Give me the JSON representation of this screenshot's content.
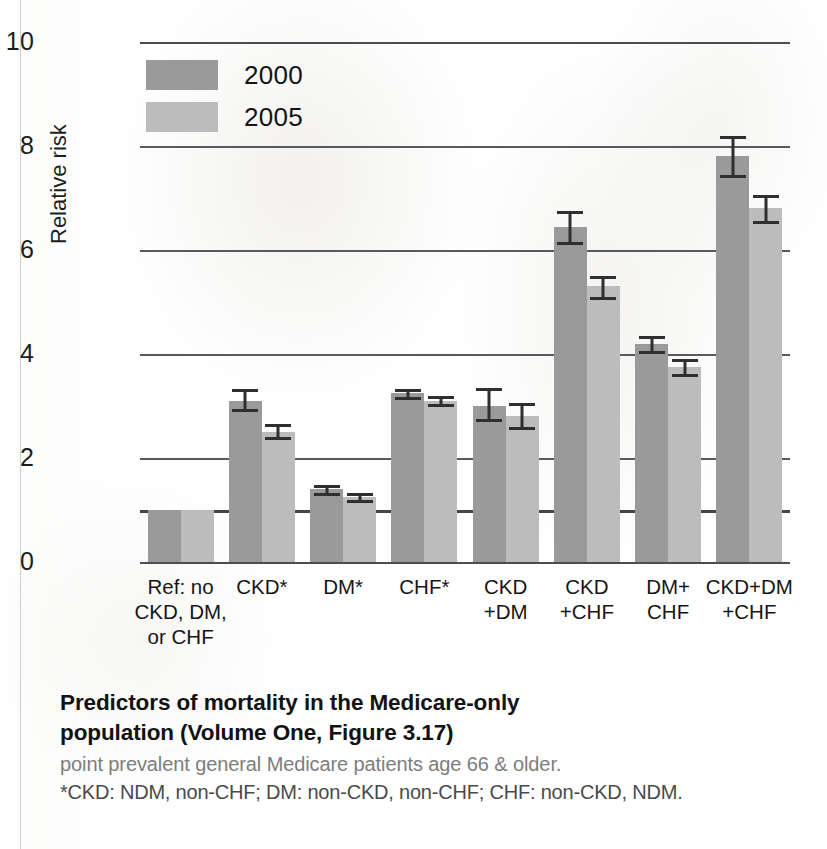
{
  "chart_data": {
    "type": "bar",
    "title": "Predictors of mortality in the Medicare-only population (Volume One, Figure 3.17)",
    "xlabel": "",
    "ylabel": "Relative risk",
    "ylim": [
      0,
      10
    ],
    "yticks": [
      0,
      2,
      4,
      6,
      8,
      10
    ],
    "grid": true,
    "legend_position": "top-left",
    "reference_line": 1,
    "categories": [
      "Ref: no\nCKD, DM,\nor CHF",
      "CKD*",
      "DM*",
      "CHF*",
      "CKD\n+DM",
      "CKD\n+CHF",
      "DM+\nCHF",
      "CKD+DM\n+CHF"
    ],
    "series": [
      {
        "name": "2000",
        "color": "#9a9a9a",
        "values": [
          1.0,
          3.1,
          1.4,
          3.25,
          3.0,
          6.45,
          4.2,
          7.8
        ],
        "err_low": [
          null,
          2.95,
          1.33,
          3.17,
          2.75,
          6.15,
          4.05,
          7.45
        ],
        "err_high": [
          null,
          3.32,
          1.48,
          3.33,
          3.35,
          6.75,
          4.35,
          8.2
        ]
      },
      {
        "name": "2005",
        "color": "#bcbcbc",
        "values": [
          1.0,
          2.5,
          1.25,
          3.1,
          2.8,
          5.3,
          3.75,
          6.8
        ],
        "err_low": [
          null,
          2.4,
          1.2,
          3.03,
          2.6,
          5.1,
          3.62,
          6.55
        ],
        "err_high": [
          null,
          2.65,
          1.33,
          3.2,
          3.05,
          5.5,
          3.9,
          7.05
        ]
      }
    ]
  },
  "legend": {
    "items": [
      {
        "label": "2000",
        "color": "#9a9a9a"
      },
      {
        "label": "2005",
        "color": "#bcbcbc"
      }
    ]
  },
  "caption": {
    "title_line1": "Predictors of mortality in the Medicare-only",
    "title_line2": "population (Volume One, Figure 3.17)",
    "subtitle": "point prevalent general Medicare patients age 66 & older.",
    "footnote": "*CKD: NDM, non-CHF; DM: non-CKD, non-CHF; CHF: non-CKD, NDM."
  }
}
